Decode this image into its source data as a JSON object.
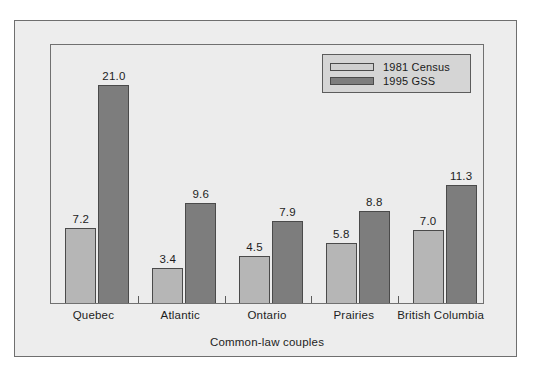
{
  "figure": {
    "background": "#ffffff",
    "frame_fill": "#ededed",
    "plot_fill": "#ececec"
  },
  "legend": {
    "position": "top-right",
    "entries": [
      {
        "label": "1981 Census",
        "color": "#cfcfcf",
        "swatch": "legend-swatch-1981-census"
      },
      {
        "label": "1995 GSS",
        "color": "#7d7d7d",
        "swatch": "legend-swatch-1995-gss"
      }
    ]
  },
  "axis": {
    "xlabel": "Common-law couples",
    "categories": [
      "Quebec",
      "Atlantic",
      "Ontario",
      "Prairies",
      "British\nColumbia"
    ]
  },
  "chart_data": {
    "type": "bar",
    "title": "",
    "subtitle": "",
    "xlabel": "Common-law couples",
    "ylabel": "",
    "grid": false,
    "legend_position": "top-right",
    "ylim": [
      0,
      24.8
    ],
    "categories": [
      "Quebec",
      "Atlantic",
      "Ontario",
      "Prairies",
      "British Columbia"
    ],
    "series": [
      {
        "name": "1981 Census",
        "color": "#b6b6b6",
        "values": [
          7.2,
          3.4,
          4.5,
          5.8,
          7.0
        ],
        "labels": [
          "7.2",
          "3.4",
          "4.5",
          "5.8",
          "7.0"
        ]
      },
      {
        "name": "1995 GSS",
        "color": "#7d7d7d",
        "values": [
          21.0,
          9.6,
          7.9,
          8.8,
          11.3
        ],
        "labels": [
          "21.0",
          "9.6",
          "7.9",
          "8.8",
          "11.3"
        ]
      }
    ]
  }
}
